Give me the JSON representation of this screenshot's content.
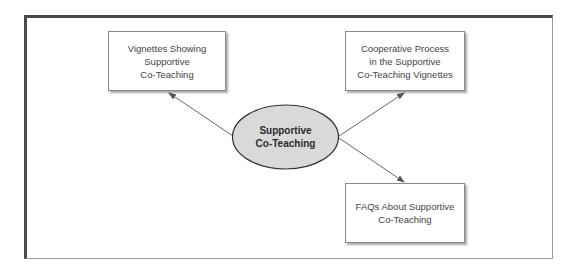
{
  "diagram": {
    "type": "hub-and-spoke concept map",
    "colors": {
      "frame_dark": "#4a4a4a",
      "frame_light": "#9a9a9a",
      "ellipse_fill": "#d9d9d9",
      "ellipse_stroke": "#333333",
      "arrow": "#666666",
      "box_border": "#8a8a8a",
      "text": "#444444"
    },
    "center": {
      "label": "Supportive\nCo-Teaching"
    },
    "nodes": [
      {
        "id": "vignettes",
        "label": "Vignettes Showing\nSupportive\nCo-Teaching"
      },
      {
        "id": "cooperative",
        "label": "Cooperative Process\nin the Supportive\nCo-Teaching Vignettes"
      },
      {
        "id": "faqs",
        "label": "FAQs About Supportive\nCo-Teaching"
      }
    ],
    "edges": [
      {
        "from": "center",
        "to": "vignettes",
        "direction": "arrow-to-target"
      },
      {
        "from": "center",
        "to": "cooperative",
        "direction": "arrow-to-target"
      },
      {
        "from": "center",
        "to": "faqs",
        "direction": "arrow-to-target"
      }
    ]
  }
}
